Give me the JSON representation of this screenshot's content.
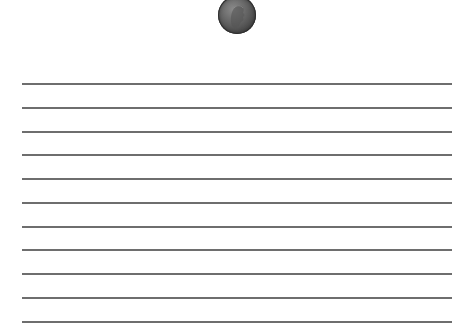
{
  "coin": {
    "icon": "penny-coin-icon",
    "description": "Lincoln one-cent coin, grayscale",
    "color": "#5a5a5a"
  },
  "ruled_lines": {
    "count": 11,
    "color": "#6e6e6e",
    "y_positions": [
      84,
      108,
      132,
      155,
      179,
      203,
      227,
      250,
      274,
      298,
      322
    ]
  }
}
